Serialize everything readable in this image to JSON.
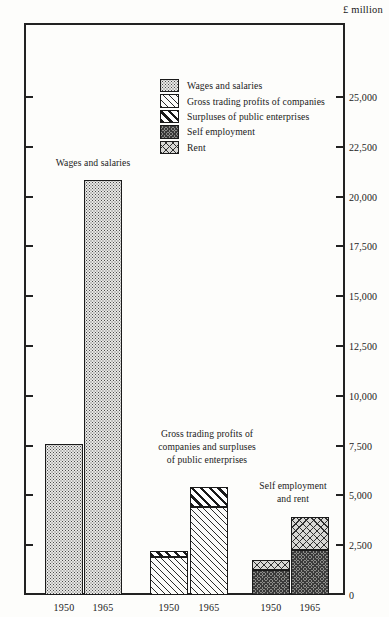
{
  "chart_data": {
    "type": "bar",
    "title": "",
    "subtitle": "",
    "xlabel": "",
    "ylabel": "",
    "unit_label": "£ million",
    "ylim": [
      0,
      27500
    ],
    "grid": false,
    "legend_position": "upper-center",
    "stacked": true,
    "tick_labels": [
      "25,000",
      "22,500",
      "20,000",
      "17,500",
      "15,000",
      "12,500",
      "10,000",
      "7,500",
      "5,000",
      "2,500",
      "0"
    ],
    "tick_values": [
      25000,
      22500,
      20000,
      17500,
      15000,
      12500,
      10000,
      7500,
      5000,
      2500,
      0
    ],
    "categories": [
      "1950",
      "1965"
    ],
    "groups": [
      {
        "name": "Wages and salaries",
        "annotation": "Wages and salaries",
        "bars": [
          {
            "category": "1950",
            "total": 7600,
            "segments": [
              {
                "series": "Wages and salaries",
                "value": 7600
              }
            ]
          },
          {
            "category": "1965",
            "total": 20850,
            "segments": [
              {
                "series": "Wages and salaries",
                "value": 20850
              }
            ]
          }
        ]
      },
      {
        "name": "Gross trading profits of companies and surpluses of public enterprises",
        "annotation": "Gross trading profits of\ncompanies and surpluses\nof public enterprises",
        "bars": [
          {
            "category": "1950",
            "total": 2200,
            "segments": [
              {
                "series": "Gross trading profits of companies",
                "value": 1900
              },
              {
                "series": "Surpluses of public enterprises",
                "value": 300
              }
            ]
          },
          {
            "category": "1965",
            "total": 5400,
            "segments": [
              {
                "series": "Gross trading profits of companies",
                "value": 4400
              },
              {
                "series": "Surpluses of public enterprises",
                "value": 1000
              }
            ]
          }
        ]
      },
      {
        "name": "Self employment and rent",
        "annotation": "Self employment\nand rent",
        "bars": [
          {
            "category": "1950",
            "total": 1750,
            "segments": [
              {
                "series": "Self employment",
                "value": 1250
              },
              {
                "series": "Rent",
                "value": 500
              }
            ]
          },
          {
            "category": "1965",
            "total": 3900,
            "segments": [
              {
                "series": "Self employment",
                "value": 2250
              },
              {
                "series": "Rent",
                "value": 1650
              }
            ]
          }
        ]
      }
    ],
    "series": [
      {
        "name": "Wages and salaries",
        "pattern": "fine-dots"
      },
      {
        "name": "Gross trading profits of companies",
        "pattern": "light-diagonal-hatch"
      },
      {
        "name": "Surpluses of public enterprises",
        "pattern": "bold-diagonal-stripes"
      },
      {
        "name": "Self employment",
        "pattern": "dark-dense-texture"
      },
      {
        "name": "Rent",
        "pattern": "cross-hatch"
      }
    ]
  },
  "legend": {
    "items": [
      {
        "label": "Wages and salaries"
      },
      {
        "label": "Gross trading profits of companies"
      },
      {
        "label": "Surpluses of public enterprises"
      },
      {
        "label": "Self employment"
      },
      {
        "label": "Rent"
      }
    ]
  },
  "axis": {
    "unit": "£ million"
  },
  "annotations": [
    {
      "text": "Wages and salaries"
    },
    {
      "text": "Gross trading profits of\ncompanies and surpluses\nof public enterprises"
    },
    {
      "text": "Self employment\nand rent"
    }
  ],
  "x_labels": [
    "1950",
    "1965",
    "1950",
    "1965",
    "1950",
    "1965"
  ]
}
